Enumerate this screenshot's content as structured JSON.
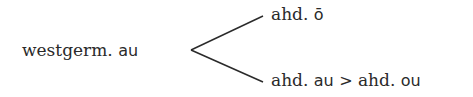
{
  "diagram": {
    "source": {
      "prefix": "westgerm.",
      "sound": "au"
    },
    "branches": [
      {
        "prefix": "ahd.",
        "sound": "ō"
      },
      {
        "prefix": "ahd.",
        "sound": "au",
        "arrow": ">",
        "prefix2": "ahd.",
        "sound2": "ou"
      }
    ],
    "line_color": "#2a2a2a"
  }
}
